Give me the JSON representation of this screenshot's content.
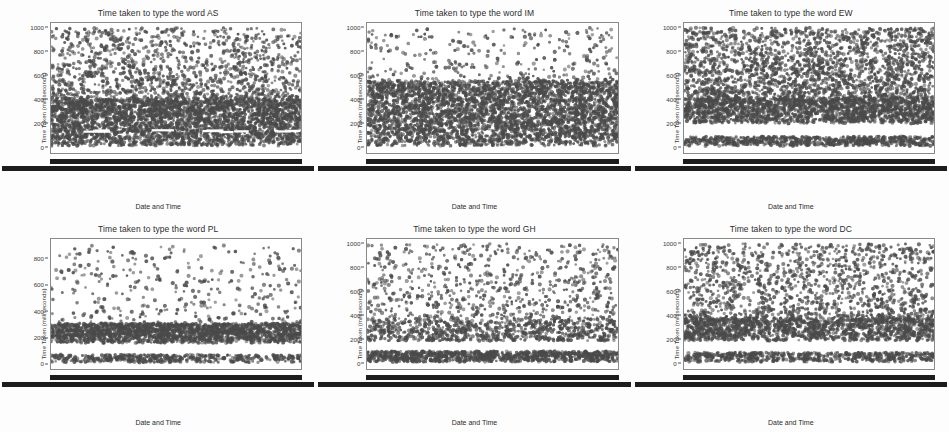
{
  "figure": {
    "background_color": "#ffffff",
    "marker_color": "#4a4a4a",
    "frame_color": "#8a8a8a",
    "rows": 2,
    "cols": 3
  },
  "common": {
    "ylabel": "Time Taken (milliseconds)",
    "xlabel": "Date and Time",
    "title_prefix": "Time taken to type the word"
  },
  "chart_data": [
    {
      "type": "scatter",
      "title": "Time taken to type the word AS",
      "word": "AS",
      "xlabel": "Date and Time",
      "ylabel": "Time Taken (milliseconds)",
      "yticks": [
        0,
        200,
        400,
        600,
        800,
        1000
      ],
      "ylim": [
        -60,
        1040
      ],
      "grid": false,
      "legend": null,
      "xtick_labels": "overlapping date-time strings (illegible, rendered as solid bar)",
      "marker_color": "#4a4a4a",
      "density_bands": [
        {
          "y_range": [
            0,
            400
          ],
          "density": "very-high",
          "description": "solid dense band"
        },
        {
          "y_range": [
            120,
            150
          ],
          "density": "gap",
          "description": "thin white gap streaks"
        },
        {
          "y_range": [
            400,
            1000
          ],
          "density": "medium",
          "description": "broad scattered cloud"
        }
      ],
      "n_points_approx": 4200
    },
    {
      "type": "scatter",
      "title": "Time taken to type the word IM",
      "word": "IM",
      "xlabel": "Date and Time",
      "ylabel": "Time Taken (milliseconds)",
      "yticks": [
        0,
        200,
        400,
        600,
        800,
        1000
      ],
      "ylim": [
        -60,
        1040
      ],
      "grid": false,
      "legend": null,
      "xtick_labels": "overlapping date-time strings (illegible, rendered as solid bar)",
      "marker_color": "#4a4a4a",
      "density_bands": [
        {
          "y_range": [
            0,
            550
          ],
          "density": "very-high",
          "description": "broad solid band"
        },
        {
          "y_range": [
            550,
            1000
          ],
          "density": "low",
          "description": "sparse outliers"
        }
      ],
      "n_points_approx": 3800
    },
    {
      "type": "scatter",
      "title": "Time taken to type the word EW",
      "word": "EW",
      "xlabel": "Date and Time",
      "ylabel": "Time Taken (milliseconds)",
      "yticks": [
        0,
        200,
        400,
        600,
        800,
        1000
      ],
      "ylim": [
        -60,
        1040
      ],
      "grid": false,
      "legend": null,
      "xtick_labels": "overlapping date-time strings (illegible, rendered as solid bar)",
      "marker_color": "#4a4a4a",
      "density_bands": [
        {
          "y_range": [
            0,
            80
          ],
          "density": "very-high",
          "description": "low solid band"
        },
        {
          "y_range": [
            80,
            190
          ],
          "density": "gap",
          "description": "white gap"
        },
        {
          "y_range": [
            190,
            400
          ],
          "density": "very-high",
          "description": "second solid band"
        },
        {
          "y_range": [
            400,
            1000
          ],
          "density": "medium-high",
          "description": "heavy upper scatter"
        }
      ],
      "n_points_approx": 4400
    },
    {
      "type": "scatter",
      "title": "Time taken to type the word PL",
      "word": "PL",
      "xlabel": "Date and Time",
      "ylabel": "Time Taken (milliseconds)",
      "yticks": [
        0,
        200,
        400,
        600,
        800
      ],
      "ylim": [
        -50,
        950
      ],
      "grid": false,
      "legend": null,
      "xtick_labels": "overlapping date-time strings (illegible, rendered as solid bar)",
      "marker_color": "#4a4a4a",
      "density_bands": [
        {
          "y_range": [
            0,
            60
          ],
          "density": "high",
          "description": "low band"
        },
        {
          "y_range": [
            60,
            150
          ],
          "density": "gap",
          "description": "white gap"
        },
        {
          "y_range": [
            150,
            300
          ],
          "density": "very-high",
          "description": "main band near 200"
        },
        {
          "y_range": [
            300,
            900
          ],
          "density": "very-low",
          "description": "sparse outliers"
        }
      ],
      "n_points_approx": 2600
    },
    {
      "type": "scatter",
      "title": "Time taken to type the word GH",
      "word": "GH",
      "xlabel": "Date and Time",
      "ylabel": "Time Taken (milliseconds)",
      "yticks": [
        0,
        200,
        400,
        600,
        800,
        1000
      ],
      "ylim": [
        -60,
        1040
      ],
      "grid": false,
      "legend": null,
      "xtick_labels": "overlapping date-time strings (illegible, rendered as solid bar)",
      "marker_color": "#4a4a4a",
      "density_bands": [
        {
          "y_range": [
            0,
            90
          ],
          "density": "very-high",
          "description": "low solid band"
        },
        {
          "y_range": [
            90,
            180
          ],
          "density": "gap",
          "description": "white gap"
        },
        {
          "y_range": [
            180,
            360
          ],
          "density": "medium-high",
          "description": "mid band near 260"
        },
        {
          "y_range": [
            360,
            1000
          ],
          "density": "low",
          "description": "sparse upper scatter"
        }
      ],
      "n_points_approx": 2400
    },
    {
      "type": "scatter",
      "title": "Time taken to type the word DC",
      "word": "DC",
      "xlabel": "Date and Time",
      "ylabel": "Time Taken (milliseconds)",
      "yticks": [
        0,
        200,
        400,
        600,
        800,
        1000
      ],
      "ylim": [
        -60,
        1040
      ],
      "grid": false,
      "legend": null,
      "xtick_labels": "overlapping date-time strings (illegible, rendered as solid bar)",
      "marker_color": "#4a4a4a",
      "density_bands": [
        {
          "y_range": [
            0,
            80
          ],
          "density": "very-high",
          "description": "low solid band"
        },
        {
          "y_range": [
            80,
            180
          ],
          "density": "gap",
          "description": "white gap"
        },
        {
          "y_range": [
            180,
            370
          ],
          "density": "very-high",
          "description": "second solid band"
        },
        {
          "y_range": [
            370,
            1000
          ],
          "density": "medium",
          "description": "upper scatter"
        }
      ],
      "n_points_approx": 3200
    }
  ]
}
